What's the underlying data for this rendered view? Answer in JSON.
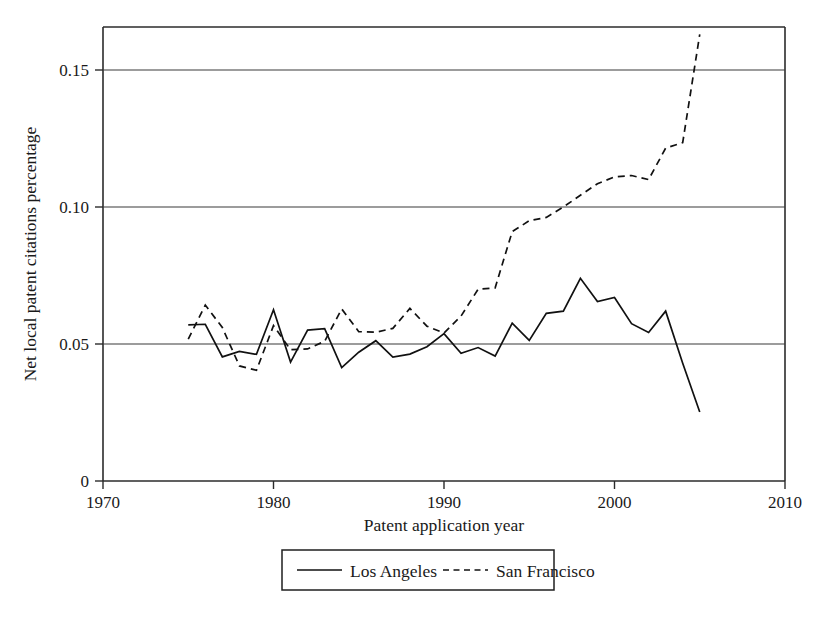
{
  "chart_data": {
    "type": "line",
    "title": "",
    "xlabel": "Patent application year",
    "ylabel": "Net local patent citations percentage",
    "xlim": [
      1970,
      2010
    ],
    "ylim": [
      0,
      0.1695
    ],
    "grid": true,
    "grid_axis": "y",
    "legend_position": "bottom-center",
    "x_ticks": [
      1970,
      1980,
      1990,
      2000,
      2010
    ],
    "x_tick_labels": [
      "1970",
      "1980",
      "1990",
      "2000",
      "2010"
    ],
    "y_ticks": [
      0,
      0.05,
      0.1,
      0.15
    ],
    "y_tick_labels": [
      "0",
      "0.05",
      "0.10",
      "0.15"
    ],
    "x": [
      1975,
      1976,
      1977,
      1978,
      1979,
      1980,
      1981,
      1982,
      1983,
      1984,
      1985,
      1986,
      1987,
      1988,
      1989,
      1990,
      1991,
      1992,
      1993,
      1994,
      1995,
      1996,
      1997,
      1998,
      1999,
      2000,
      2001,
      2002,
      2003,
      2004,
      2005
    ],
    "series": [
      {
        "name": "Los Angeles",
        "style": "solid",
        "color": "#111111",
        "values": [
          0.057,
          0.0572,
          0.0453,
          0.0473,
          0.0462,
          0.0625,
          0.0434,
          0.0551,
          0.0556,
          0.0414,
          0.047,
          0.0512,
          0.0452,
          0.0463,
          0.049,
          0.0538,
          0.0466,
          0.0487,
          0.0456,
          0.0576,
          0.0513,
          0.0612,
          0.062,
          0.074,
          0.0655,
          0.067,
          0.0574,
          0.0542,
          0.062,
          0.043,
          0.0252
        ]
      },
      {
        "name": "San Francisco",
        "style": "dashed",
        "color": "#111111",
        "values": [
          0.0518,
          0.0642,
          0.056,
          0.042,
          0.0404,
          0.0567,
          0.0479,
          0.0482,
          0.051,
          0.0628,
          0.0545,
          0.0543,
          0.0557,
          0.063,
          0.0565,
          0.054,
          0.0602,
          0.07,
          0.0705,
          0.091,
          0.095,
          0.0962,
          0.1,
          0.1043,
          0.1085,
          0.111,
          0.1115,
          0.11,
          0.1215,
          0.1235,
          0.163
        ]
      }
    ]
  },
  "legend": {
    "entries": [
      {
        "label": "Los Angeles",
        "style": "solid"
      },
      {
        "label": "San Francisco",
        "style": "dashed"
      }
    ]
  }
}
